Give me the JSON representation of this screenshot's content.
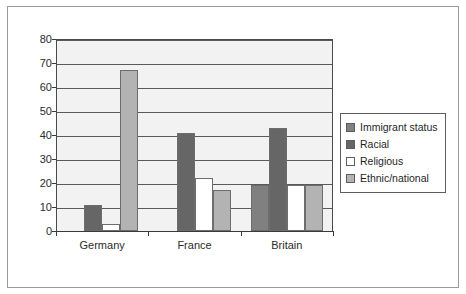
{
  "chart_data": {
    "type": "bar",
    "title": "",
    "subtitle": "",
    "xlabel": "",
    "ylabel": "",
    "categories": [
      "Germany",
      "France",
      "Britain"
    ],
    "series": [
      {
        "name": "Immigrant status",
        "color": "#808080",
        "values": [
          0,
          0,
          19
        ]
      },
      {
        "name": "Racial",
        "color": "#666666",
        "values": [
          11,
          41,
          43
        ]
      },
      {
        "name": "Religious",
        "color": "#ffffff",
        "values": [
          3,
          22,
          19
        ]
      },
      {
        "name": "Ethnic/national",
        "color": "#b3b3b3",
        "values": [
          67,
          17,
          19
        ]
      }
    ],
    "ylim": [
      0,
      80
    ],
    "y_ticks": [
      0,
      10,
      20,
      30,
      40,
      50,
      60,
      70,
      80
    ],
    "y_tick_labels": [
      "0",
      "10",
      "20",
      "30",
      "40",
      "50",
      "60",
      "70",
      "80"
    ],
    "grid": true,
    "grid_axis": "y",
    "legend_position": "right",
    "plot_background": "#f2f2f2",
    "frame_color": "#9a9a9a"
  },
  "legend": {
    "items": [
      {
        "label": "Immigrant status"
      },
      {
        "label": "Racial"
      },
      {
        "label": "Religious"
      },
      {
        "label": "Ethnic/national"
      }
    ]
  }
}
